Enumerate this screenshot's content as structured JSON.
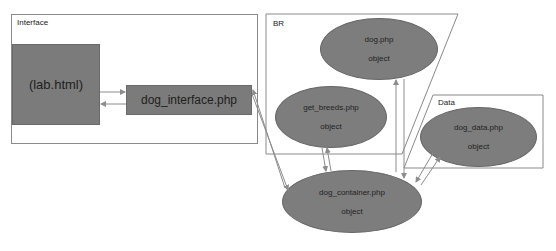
{
  "frames": {
    "interface": {
      "label": "Interface"
    },
    "br": {
      "label": "BR"
    },
    "data": {
      "label": "Data"
    }
  },
  "nodes": {
    "lab_html": {
      "label": "(lab.html)"
    },
    "dog_interface": {
      "label": "dog_interface.php"
    },
    "dog_php": {
      "name": "dog.php",
      "type": "object"
    },
    "get_breeds": {
      "name": "get_breeds.php",
      "type": "object"
    },
    "dog_data": {
      "name": "dog_data.php",
      "type": "object"
    },
    "dog_container": {
      "name": "dog_container.php",
      "type": "object"
    }
  },
  "edges": [
    {
      "from": "lab_html",
      "to": "dog_interface",
      "bidirectional": true
    },
    {
      "from": "dog_interface",
      "to": "dog_container",
      "bidirectional": true
    },
    {
      "from": "get_breeds",
      "to": "dog_container",
      "bidirectional": true
    },
    {
      "from": "dog_php",
      "to": "dog_container",
      "bidirectional": true
    },
    {
      "from": "dog_data",
      "to": "dog_container",
      "bidirectional": true
    }
  ],
  "colors": {
    "node_fill": "#7b7b7b",
    "frame_border": "#8a8a8a",
    "arrow": "#8c8c8c"
  }
}
